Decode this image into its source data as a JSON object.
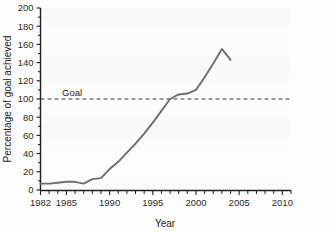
{
  "chart_data": {
    "type": "line",
    "title": "",
    "xlabel": "Year",
    "ylabel": "Percentage of goal achieved",
    "xlim": [
      1982,
      2011
    ],
    "ylim": [
      0,
      200
    ],
    "xticks": [
      1982,
      1985,
      1990,
      1995,
      2000,
      2005,
      2010
    ],
    "xtick_labels": [
      "1982",
      "1985",
      "1990",
      "1995",
      "2000",
      "2005",
      "2010"
    ],
    "yticks": [
      0,
      20,
      40,
      60,
      80,
      100,
      120,
      140,
      160,
      180,
      200
    ],
    "ytick_labels": [
      "0",
      "20",
      "40",
      "60",
      "80",
      "100",
      "120",
      "140",
      "160",
      "180",
      "200"
    ],
    "grid": false,
    "legend": "none",
    "line_color": "#6e6e6e",
    "annotations": [
      {
        "name": "goal-line",
        "label": "Goal",
        "type": "hline",
        "value": 100,
        "style": "dashed",
        "color": "#3a3a3a"
      }
    ],
    "series": [
      {
        "name": "Percentage of goal achieved",
        "color": "#6e6e6e",
        "x": [
          1982,
          1983,
          1984,
          1985,
          1986,
          1987,
          1988,
          1989,
          1990,
          1991,
          1992,
          1993,
          1994,
          1995,
          1996,
          1997,
          1998,
          1999,
          2000,
          2001,
          2002,
          2003,
          2004
        ],
        "values": [
          7,
          7,
          8,
          9,
          9,
          7,
          12,
          13,
          23,
          31,
          41,
          51,
          62,
          74,
          87,
          100,
          105,
          106,
          110,
          124,
          139,
          155,
          143
        ]
      }
    ]
  },
  "axis": {
    "x_title": "Year",
    "y_title": "Percentage of goal achieved"
  }
}
